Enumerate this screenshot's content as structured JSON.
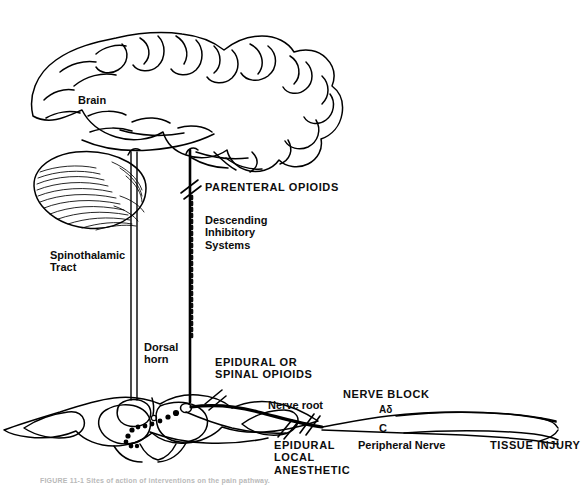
{
  "figure": {
    "caption": "FIGURE 11-1 Sites of action of interventions on the pain pathway.",
    "ink_color": "#000000",
    "background": "#ffffff"
  },
  "labels": {
    "brain": "Brain",
    "parenteral_opioids": "PARENTERAL OPIOIDS",
    "descending_inhibitory_systems": "Descending\nInhibitory\nSystems",
    "spinothalamic_tract": "Spinothalamic\nTract",
    "dorsal_horn": "Dorsal\nhorn",
    "epidural_or_spinal_opioids": "EPIDURAL OR\nSPINAL OPIOIDS",
    "nerve_root": "Nerve root",
    "nerve_block": "NERVE BLOCK",
    "fiber_a_delta": "Aδ",
    "fiber_c": "C",
    "epidural_local_anesthetic": "EPIDURAL\nLOCAL\nANESTHETIC",
    "peripheral_nerve": "Peripheral Nerve",
    "tissue_injury": "TISSUE INJURY"
  },
  "anatomy": {
    "cerebrum": "cerebral cortex outline with gyri and sulci",
    "cerebellum": "cerebellum with horizontal folia striations",
    "spinal_cord": "transverse spinal cord section with butterfly gray matter",
    "ascending_tract": "spinothalamic ascending tract, thin double line",
    "descending_tract": "descending inhibitory tract, thick stippled line",
    "synapse_dots": "dotted synaptic relay in dorsal horn",
    "blockade_marks": "double-slash blockade hatch marks"
  }
}
